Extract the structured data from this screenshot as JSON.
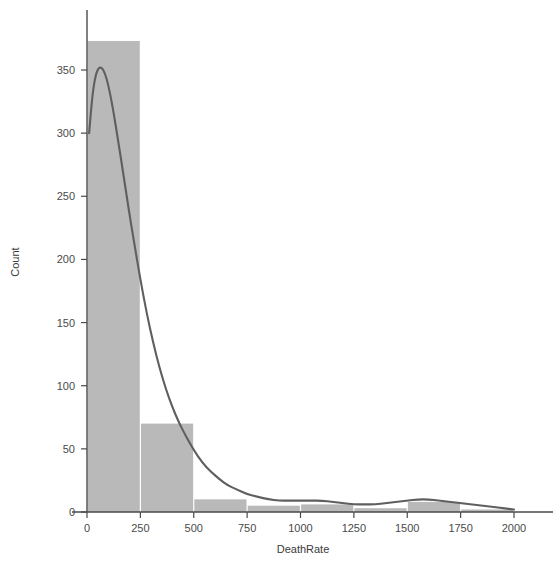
{
  "figure": {
    "width": 560,
    "height": 564,
    "background": "#ffffff"
  },
  "colors": {
    "bar_fill": "#b9b9b9",
    "kde_line": "#5f5f5f",
    "axis": "#4a4a4a",
    "text": "#3a3a3a",
    "background": "#ffffff"
  },
  "axes": {
    "x_title": "DeathRate",
    "y_title": "Count",
    "x_ticks": [
      "0",
      "250",
      "500",
      "750",
      "1000",
      "1250",
      "1500",
      "1750",
      "2000"
    ],
    "y_ticks": [
      "0",
      "50",
      "100",
      "150",
      "200",
      "250",
      "300",
      "350"
    ]
  },
  "chart_data": {
    "type": "bar",
    "title": "",
    "subtitle": "",
    "xlabel": "DeathRate",
    "ylabel": "Count",
    "xlim": [
      -60,
      2100
    ],
    "ylim": [
      0,
      380
    ],
    "grid": false,
    "legend": null,
    "bin_width": 250,
    "bin_edges": [
      0,
      250,
      500,
      750,
      1000,
      1250,
      1500,
      1750,
      2000
    ],
    "categories": [
      "0-250",
      "250-500",
      "500-750",
      "750-1000",
      "1000-1250",
      "1250-1500",
      "1500-1750",
      "1750-2000"
    ],
    "values": [
      373,
      70,
      10,
      5,
      6,
      3,
      8,
      2
    ],
    "x_tick_values": [
      0,
      250,
      500,
      750,
      1000,
      1250,
      1500,
      1750,
      2000
    ],
    "y_tick_values": [
      0,
      50,
      100,
      150,
      200,
      250,
      300,
      350
    ],
    "series": [
      {
        "name": "histogram",
        "type": "bar",
        "values": [
          373,
          70,
          10,
          5,
          6,
          3,
          8,
          2
        ]
      },
      {
        "name": "kde",
        "type": "line",
        "note": "kernel density estimate scaled to count axis, truncated at left edge near x=10",
        "x": [
          10,
          25,
          40,
          55,
          70,
          85,
          100,
          120,
          145,
          170,
          195,
          220,
          250,
          280,
          310,
          340,
          370,
          400,
          430,
          460,
          500,
          540,
          580,
          620,
          660,
          700,
          750,
          800,
          850,
          900,
          950,
          1000,
          1050,
          1100,
          1150,
          1200,
          1250,
          1300,
          1350,
          1400,
          1450,
          1500,
          1550,
          1600,
          1650,
          1700,
          1750,
          1800,
          1850,
          1900,
          1950,
          2000
        ],
        "y": [
          300,
          330,
          346,
          352,
          352,
          347,
          338,
          321,
          295,
          268,
          240,
          214,
          184,
          157,
          134,
          114,
          97,
          83,
          71,
          61,
          49,
          39,
          32,
          26,
          21,
          18,
          14,
          12,
          10,
          9,
          9,
          9,
          9,
          9,
          8,
          7,
          6,
          6,
          6,
          7,
          8,
          9,
          10,
          10,
          9,
          8,
          7,
          6,
          5,
          4,
          3,
          2
        ]
      }
    ]
  }
}
